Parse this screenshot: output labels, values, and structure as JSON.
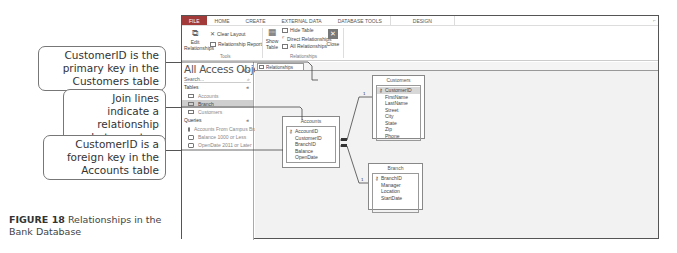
{
  "callouts": [
    {
      "text": "CustomerID is the primary key in the Customers table"
    },
    {
      "text": "Join lines indicate a relationship between two tables"
    },
    {
      "text": "CustomerID is a foreign key in the Accounts table"
    }
  ],
  "caption": {
    "label": "FIGURE 18",
    "text": "Relationships in the Bank Database"
  },
  "menubar": {
    "tabs": [
      "FILE",
      "HOME",
      "CREATE",
      "EXTERNAL DATA",
      "DATABASE TOOLS",
      "DESIGN"
    ]
  },
  "ribbon": {
    "tools": {
      "edit_relationships": "Edit Relationships",
      "clear_layout": "Clear Layout",
      "relationship_report": "Relationship Report",
      "group_label": "Tools"
    },
    "relationships": {
      "show_table": "Show Table",
      "hide_table": "Hide Table",
      "direct_relationships": "Direct Relationships",
      "all_relationships": "All Relationships",
      "close": "Close",
      "group_label": "Relationships"
    }
  },
  "nav": {
    "title": "All Access Obje...",
    "search_placeholder": "Search...",
    "sections": [
      {
        "label": "Tables",
        "items": [
          "Accounts",
          "Branch",
          "Customers"
        ]
      },
      {
        "label": "Queries",
        "items": [
          "Accounts From Campus Branch",
          "Balance 1000 or Less",
          "OpenDate 2011 or Later"
        ]
      }
    ],
    "selected": "Branch"
  },
  "doc_tab": {
    "label": "Relationships"
  },
  "tables": {
    "customers": {
      "title": "Customers",
      "fields": [
        "CustomerID",
        "FirstName",
        "LastName",
        "Street",
        "City",
        "State",
        "Zip",
        "Phone"
      ]
    },
    "accounts": {
      "title": "Accounts",
      "fields": [
        "AccountID",
        "CustomerID",
        "BranchID",
        "Balance",
        "OpenDate"
      ]
    },
    "branch": {
      "title": "Branch",
      "fields": [
        "BranchID",
        "Manager",
        "Location",
        "StartDate"
      ]
    }
  },
  "join_markers": {
    "one": "1",
    "many": "∞"
  }
}
